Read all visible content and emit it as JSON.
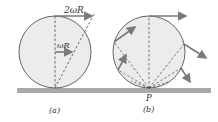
{
  "panel_a": {
    "caption": "(a)",
    "top_velocity_label": "2ωR",
    "center_velocity_label": "ωR"
  },
  "panel_b": {
    "caption": "(b)",
    "contact_point_label": "P"
  },
  "colors": {
    "disk_fill": "#ececec",
    "outline": "#555555",
    "ground": "#a8a8a8",
    "arrow": "#7a7a7a"
  }
}
